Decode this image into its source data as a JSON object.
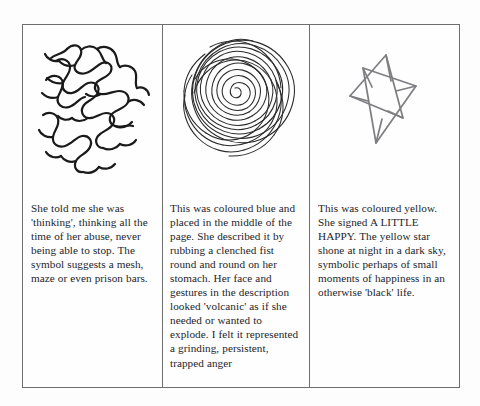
{
  "figure": {
    "background_color": "#fdfdfd",
    "frame_color": "#6f6f72",
    "text_color": "#24242a"
  },
  "panels": [
    {
      "id": "panel-thinking",
      "drawing": {
        "name": "mesh-maze-scribble-drawing",
        "description": "tangled mesh of thick black wavy lines suggesting a maze or prison bars",
        "stroke_color": "#1a1a1a",
        "stroke_width": 2.1
      },
      "caption": "She told me she was 'thinking', thinking all the time of her abuse, never being able to stop. The symbol suggests a mesh, maze or even prison bars."
    },
    {
      "id": "panel-volcanic",
      "drawing": {
        "name": "spiral-scribble-drawing",
        "description": "dense outward spiral of looping lines, drawn as a clenched fist round and round",
        "stroke_color": "#2a2a2a",
        "stroke_width": 1.05
      },
      "caption": "This was coloured blue and placed in the middle of the page. She described it by rubbing a clenched fist round and round on her stomach. Her face and gestures in the description looked 'volcanic' as if she needed or wanted to explode. I felt it represented a grinding, persistent, trapped anger"
    },
    {
      "id": "panel-happy",
      "drawing": {
        "name": "star-drawing",
        "description": "hand-drawn lopsided six-pointed star made of two overlapping triangles",
        "stroke_color": "#7e7e82",
        "stroke_width": 1.6
      },
      "caption": "This was coloured yellow. She signed A LITTLE HAPPY. The yellow star shone at night in a dark sky, symbolic perhaps of small moments of happiness in an otherwise 'black' life."
    }
  ]
}
